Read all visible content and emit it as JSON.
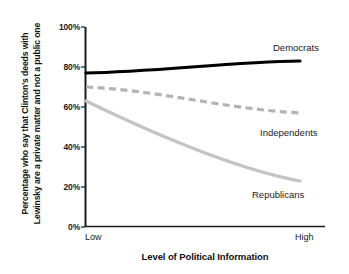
{
  "chart_data": {
    "type": "line",
    "title": "",
    "xlabel": "Level of Political Information",
    "ylabel": "Percentage who say that Clinton's deeds with Lewinsky are a private matter and not a public one",
    "x": [
      "Low",
      "High"
    ],
    "xtick_labels": [
      "Low",
      "High"
    ],
    "ytick_labels": [
      "0%",
      "20%",
      "40%",
      "60%",
      "80%",
      "100%"
    ],
    "ytick_values": [
      0,
      20,
      40,
      60,
      80,
      100
    ],
    "ylim": [
      0,
      100
    ],
    "grid": false,
    "legend_position": "inline-right",
    "series": [
      {
        "name": "Democrats",
        "values": [
          77,
          83
        ],
        "color": "#000000",
        "style": "solid",
        "width": 3.2
      },
      {
        "name": "Independents",
        "values": [
          70,
          57
        ],
        "color": "#b3b3b3",
        "style": "dashed",
        "width": 3.2
      },
      {
        "name": "Republicans",
        "values": [
          63,
          23
        ],
        "color": "#c4c4c4",
        "style": "solid",
        "width": 3.2
      }
    ],
    "annotations": [
      {
        "text": "Democrats",
        "series": "Democrats"
      },
      {
        "text": "Independents",
        "series": "Independents"
      },
      {
        "text": "Republicans",
        "series": "Republicans"
      }
    ]
  },
  "axis": {
    "y_title": "Percentage who say that Clinton's deeds with Lewinsky are a private matter and not a public one",
    "x_title": "Level of Political Information",
    "y_ticks": {
      "t100": "100%",
      "t80": "80%",
      "t60": "60%",
      "t40": "40%",
      "t20": "20%",
      "t0": "0%"
    },
    "x_ticks": {
      "low": "Low",
      "high": "High"
    }
  },
  "labels": {
    "democrats": "Democrats",
    "independents": "Independents",
    "republicans": "Republicans"
  },
  "colors": {
    "democrats": "#000000",
    "independents": "#b3b3b3",
    "republicans": "#c4c4c4",
    "axis": "#1a1a1a",
    "background": "#ffffff"
  }
}
